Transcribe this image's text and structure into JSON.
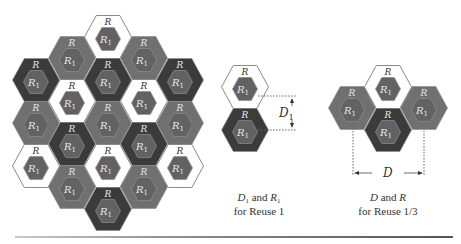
{
  "figure": {
    "colors": {
      "white": "#ffffff",
      "gray": "#707070",
      "dark": "#3b3b3b",
      "inner": "#626262",
      "inner_stroke": "#8e8e8e",
      "outline": "#8a8a8a",
      "label_light": "#e8e8e8",
      "label_dark": "#333333"
    },
    "cell_label_outer": "R",
    "cell_label_inner": "R",
    "cell_label_inner_sub": "1",
    "hex": {
      "half_w": 23.5,
      "half_h": 21.5,
      "inner_half_w": 12.5,
      "inner_half_h": 11.5
    },
    "cluster": [
      {
        "cx": 36,
        "cy": 80,
        "fill": "dark"
      },
      {
        "cx": 36,
        "cy": 123,
        "fill": "gray"
      },
      {
        "cx": 36,
        "cy": 166,
        "fill": "white"
      },
      {
        "cx": 72,
        "cy": 58,
        "fill": "gray"
      },
      {
        "cx": 72,
        "cy": 101,
        "fill": "white"
      },
      {
        "cx": 72,
        "cy": 144,
        "fill": "dark"
      },
      {
        "cx": 72,
        "cy": 187,
        "fill": "gray"
      },
      {
        "cx": 108,
        "cy": 37,
        "fill": "white"
      },
      {
        "cx": 108,
        "cy": 80,
        "fill": "dark"
      },
      {
        "cx": 108,
        "cy": 123,
        "fill": "gray"
      },
      {
        "cx": 108,
        "cy": 166,
        "fill": "white"
      },
      {
        "cx": 108,
        "cy": 209,
        "fill": "dark"
      },
      {
        "cx": 144,
        "cy": 58,
        "fill": "gray"
      },
      {
        "cx": 144,
        "cy": 101,
        "fill": "white"
      },
      {
        "cx": 144,
        "cy": 144,
        "fill": "dark"
      },
      {
        "cx": 144,
        "cy": 187,
        "fill": "gray"
      },
      {
        "cx": 180,
        "cy": 80,
        "fill": "dark"
      },
      {
        "cx": 180,
        "cy": 123,
        "fill": "gray"
      },
      {
        "cx": 180,
        "cy": 166,
        "fill": "white"
      }
    ],
    "reuse1": {
      "hexes": [
        {
          "cx": 245,
          "cy": 87,
          "fill": "white"
        },
        {
          "cx": 245,
          "cy": 130,
          "fill": "dark"
        }
      ],
      "distance_label": "D",
      "distance_sub": "1",
      "caption_line1_a": "D",
      "caption_line1_a_sub": "1",
      "caption_line1_mid": " and ",
      "caption_line1_b": "R",
      "caption_line1_b_sub": "1",
      "caption_line2": "for Reuse 1"
    },
    "reuse13": {
      "hexes": [
        {
          "cx": 388,
          "cy": 87,
          "fill": "white"
        },
        {
          "cx": 352,
          "cy": 108,
          "fill": "gray"
        },
        {
          "cx": 424,
          "cy": 108,
          "fill": "gray"
        },
        {
          "cx": 388,
          "cy": 130,
          "fill": "dark"
        }
      ],
      "distance_label": "D",
      "caption_line1_a": "D",
      "caption_line1_mid": " and ",
      "caption_line1_b": "R",
      "caption_line2": "for Reuse 1/3"
    }
  }
}
